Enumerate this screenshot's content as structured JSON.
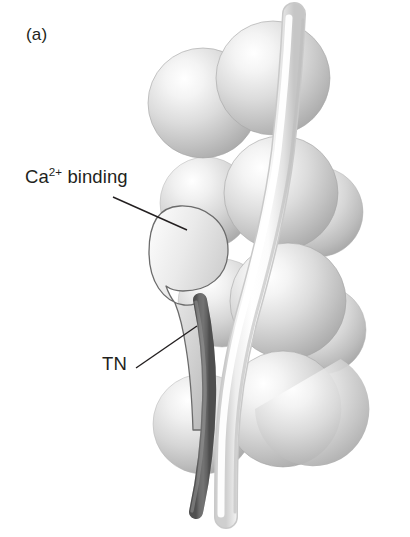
{
  "figure": {
    "panel_label": "(a)",
    "background_color": "#ffffff",
    "width": 410,
    "height": 537
  },
  "labels": {
    "calcium_binding": {
      "prefix": "Ca",
      "superscript": "2+",
      "suffix": " binding",
      "full_text": "Ca2+ binding"
    },
    "troponin": "TN"
  },
  "colors": {
    "text": "#231f20",
    "leader_line": "#231f20",
    "actin_sphere_light": "#fdfdfd",
    "actin_sphere_mid": "#d3d3d3",
    "actin_sphere_dark": "#a9a9a9",
    "actin_outline": "#8f8f8f",
    "troponin_fill_light": "#f2f2f2",
    "troponin_fill_dark": "#b8b8b8",
    "troponin_outline": "#6e6e6e",
    "tropomyosin_dark": "#6f6f6f",
    "tropomyosin_dark_edge": "#4a4a4a",
    "tropomyosin_light": "#ffffff",
    "tropomyosin_light_edge": "#d6d6d6"
  },
  "diagram": {
    "type": "molecular-structure-illustration",
    "elements": [
      {
        "name": "actin-monomer-sphere",
        "count": 9,
        "shape": "sphere",
        "shading": "upper-left highlight"
      },
      {
        "name": "tropomyosin-light-strand",
        "shape": "tube",
        "color": "white"
      },
      {
        "name": "tropomyosin-dark-strand",
        "shape": "tube",
        "color": "dark gray"
      },
      {
        "name": "troponin-complex",
        "shape": "teardrop",
        "label": "TN"
      }
    ],
    "leader_lines": [
      {
        "name": "calcium-binding-leader",
        "from": [
          113,
          197
        ],
        "to": [
          186,
          229
        ]
      },
      {
        "name": "troponin-leader",
        "from": [
          136,
          368
        ],
        "to": [
          196,
          327
        ]
      }
    ]
  },
  "spheres": [
    {
      "cx": 203,
      "cy": 103,
      "r": 54
    },
    {
      "cx": 272,
      "cy": 77,
      "r": 56
    },
    {
      "cx": 206,
      "cy": 203,
      "r": 45
    },
    {
      "cx": 280,
      "cy": 193,
      "r": 56
    },
    {
      "cx": 287,
      "cy": 300,
      "r": 57
    },
    {
      "cx": 220,
      "cy": 300,
      "r": 42
    },
    {
      "cx": 282,
      "cy": 408,
      "r": 57
    },
    {
      "cx": 203,
      "cy": 424,
      "r": 49
    },
    {
      "cx": 318,
      "cy": 210,
      "r": 44
    }
  ]
}
